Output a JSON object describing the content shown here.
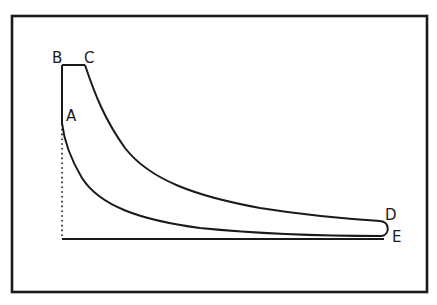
{
  "diagram": {
    "type": "indicator-diagram",
    "colors": {
      "background": "#ffffff",
      "stroke": "#1a1a1a"
    },
    "frame": {
      "x": 12,
      "y": 16,
      "width": 415,
      "height": 276
    },
    "points": {
      "A": {
        "label": "A",
        "x": 62,
        "y": 123,
        "label_x": 66,
        "label_y": 121
      },
      "B": {
        "label": "B",
        "x": 62,
        "y": 65,
        "label_x": 52,
        "label_y": 63
      },
      "C": {
        "label": "C",
        "x": 85,
        "y": 65,
        "label_x": 84,
        "label_y": 63
      },
      "D": {
        "label": "D",
        "x": 385,
        "y": 222,
        "label_x": 385,
        "label_y": 220
      },
      "E": {
        "label": "E",
        "x": 385,
        "y": 237,
        "label_x": 392,
        "label_y": 242
      }
    },
    "segments": [
      {
        "name": "B-A vertical",
        "from": "B",
        "to": "A",
        "style": "solid"
      },
      {
        "name": "B-C top",
        "from": "B",
        "to": "C",
        "style": "solid"
      },
      {
        "name": "C-D expansion curve",
        "from": "C",
        "to": "D",
        "style": "solid"
      },
      {
        "name": "E-A compression curve",
        "from": "E",
        "to": "A",
        "style": "solid"
      },
      {
        "name": "dotted ordinate",
        "from": "A",
        "to": "origin",
        "style": "dotted"
      },
      {
        "name": "baseline",
        "from": "origin",
        "to": "E",
        "style": "solid"
      }
    ]
  }
}
